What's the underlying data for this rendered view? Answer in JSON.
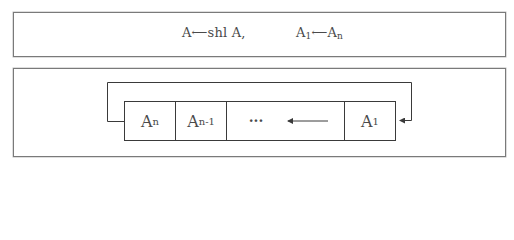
{
  "top_panel": {
    "formula1": {
      "lhs": "A",
      "arrow": "⟵",
      "rhs": "shl A,"
    },
    "formula2": {
      "lhs_base": "A",
      "lhs_sub": "1",
      "arrow": "⟵",
      "rhs_base": "A",
      "rhs_sub": "n"
    }
  },
  "register": {
    "cells": [
      {
        "base": "A",
        "sub": "n"
      },
      {
        "base": "A",
        "sub": "n-1"
      },
      {
        "base": "···",
        "sub": ""
      },
      {
        "base": "A",
        "sub": "1"
      }
    ],
    "internal_shift_direction": "left",
    "feedback_loop": "A_n output wraps around to A_1 input"
  },
  "colors": {
    "line": "#3a3a3a",
    "border": "#7a7a7a",
    "text": "#4a4a4a"
  }
}
